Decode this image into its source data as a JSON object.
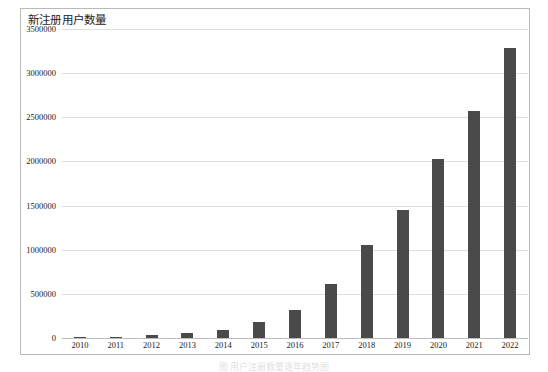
{
  "figure": {
    "title": "新注册用户数量",
    "caption": "图         用户注册数量逐年趋势图",
    "bar_color": "#4a4a4a",
    "gridline_color": "#dedede",
    "frame_color": "#b9b9b9"
  },
  "chart_data": {
    "type": "bar",
    "title": "新注册用户数量",
    "xlabel": "",
    "ylabel": "",
    "categories": [
      "2010",
      "2011",
      "2012",
      "2013",
      "2014",
      "2015",
      "2016",
      "2017",
      "2018",
      "2019",
      "2020",
      "2021",
      "2022"
    ],
    "values": [
      2000,
      12000,
      35000,
      55000,
      90000,
      180000,
      320000,
      610000,
      1050000,
      1450000,
      2030000,
      2570000,
      3290000
    ],
    "ylim": [
      0,
      3500000
    ],
    "yticks": [
      0,
      500000,
      1000000,
      1500000,
      2000000,
      2500000,
      3000000,
      3500000
    ],
    "ytick_labels": [
      "0",
      "500000",
      "1000000",
      "1500000",
      "2000000",
      "2500000",
      "3000000",
      "3500000"
    ],
    "grid": true,
    "legend": null,
    "series": [
      {
        "name": "新注册用户数量",
        "values": [
          2000,
          12000,
          35000,
          55000,
          90000,
          180000,
          320000,
          610000,
          1050000,
          1450000,
          2030000,
          2570000,
          3290000
        ]
      }
    ]
  }
}
